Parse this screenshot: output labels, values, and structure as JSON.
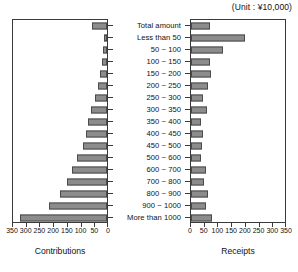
{
  "unit_note": "(Unit : ¥10,000)",
  "left_axis_title": "Contributions",
  "right_axis_title": "Receipts",
  "chart_data": {
    "type": "bar",
    "orientation": "horizontal",
    "layout": "butterfly-pyramid",
    "title": "",
    "subtitle": "(Unit : ¥10,000)",
    "categories": [
      "Total amount",
      "Less than 50",
      "50 ~ 100",
      "100 ~ 150",
      "150 ~ 200",
      "200 ~ 250",
      "250 ~ 300",
      "300 ~ 350",
      "350 ~ 400",
      "400 ~ 450",
      "450 ~ 500",
      "500 ~ 600",
      "600 ~ 700",
      "700 ~ 800",
      "800 ~ 900",
      "900 ~ 1000",
      "More than 1000"
    ],
    "series": [
      {
        "name": "Contributions",
        "side": "left",
        "xlabel": "Contributions",
        "ylabel": "",
        "xlim": [
          0,
          350
        ],
        "direction": "right-to-left",
        "ticks": [
          350,
          300,
          250,
          200,
          150,
          100,
          50,
          0
        ],
        "values": [
          55,
          10,
          15,
          20,
          25,
          35,
          45,
          60,
          70,
          80,
          90,
          110,
          130,
          150,
          175,
          215,
          325
        ]
      },
      {
        "name": "Receipts",
        "side": "right",
        "xlabel": "Receipts",
        "ylabel": "",
        "xlim": [
          0,
          350
        ],
        "direction": "left-to-right",
        "ticks": [
          0,
          50,
          100,
          150,
          200,
          250,
          300,
          350
        ],
        "values": [
          72,
          200,
          118,
          72,
          73,
          62,
          45,
          58,
          38,
          45,
          40,
          38,
          55,
          48,
          65,
          55,
          80
        ]
      }
    ],
    "grid": false,
    "legend": "none",
    "bar_color": "#8c8c8c",
    "bar_border_color": "#4a4a4a",
    "axis_color": "#3a3a3a"
  }
}
